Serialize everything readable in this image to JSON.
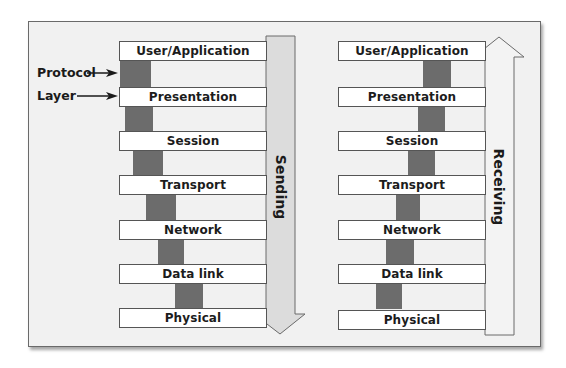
{
  "figure": {
    "labels": {
      "protocol": "Protocol",
      "layer": "Layer"
    },
    "sending": {
      "direction_label": "Sending",
      "direction": "down",
      "layers": [
        "User/Application",
        "Presentation",
        "Session",
        "Transport",
        "Network",
        "Data link",
        "Physical"
      ]
    },
    "receiving": {
      "direction_label": "Receiving",
      "direction": "up",
      "layers": [
        "User/Application",
        "Presentation",
        "Session",
        "Transport",
        "Network",
        "Data link",
        "Physical"
      ]
    },
    "colors": {
      "frame_bg": "#f1f1f1",
      "box_bg": "#ffffff",
      "protocol_bar": "#6c6c6c",
      "arrow_fill": "#dcdcdc",
      "outline": "#555555"
    }
  }
}
